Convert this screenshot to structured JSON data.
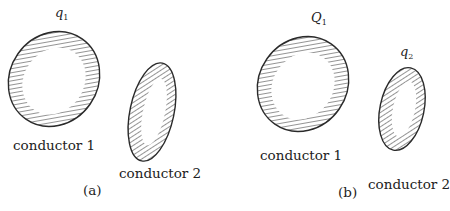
{
  "panels": [
    {
      "id": "a",
      "caption": "(a)",
      "charge_label": {
        "symbol": "q",
        "sub": "1"
      },
      "conductors": [
        {
          "label": "conductor 1"
        },
        {
          "label": "conductor 2"
        }
      ]
    },
    {
      "id": "b",
      "caption": "(b)",
      "charge_labels": [
        {
          "symbol": "Q",
          "sub": "1"
        },
        {
          "symbol": "q",
          "sub": "2"
        }
      ],
      "conductors": [
        {
          "label": "conductor 1"
        },
        {
          "label": "conductor 2"
        }
      ]
    }
  ],
  "colors": {
    "stroke": "#2a2a2a",
    "hatch": "#3a3a3a",
    "background": "#ffffff"
  }
}
